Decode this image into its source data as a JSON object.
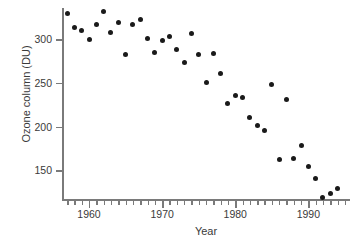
{
  "chart_data": {
    "type": "scatter",
    "title": "",
    "xlabel": "Year",
    "ylabel": "Ozone column (DU)",
    "xlim": [
      1956.3,
      1995.7
    ],
    "ylim": [
      116,
      336
    ],
    "grid": false,
    "legend": null,
    "marker": {
      "shape": "circle",
      "color": "#1a1a1a",
      "size": 5
    },
    "xticks_major": [
      1960,
      1970,
      1980,
      1990
    ],
    "xtick_labels": [
      "1960",
      "1970",
      "1980",
      "1990"
    ],
    "xticks_minor_step": 1,
    "yticks": [
      150,
      200,
      250,
      300
    ],
    "ytick_labels": [
      "150",
      "200",
      "250",
      "300"
    ],
    "x": [
      1957,
      1958,
      1959,
      1960,
      1961,
      1962,
      1963,
      1964,
      1965,
      1966,
      1967,
      1968,
      1969,
      1970,
      1971,
      1972,
      1973,
      1974,
      1975,
      1976,
      1977,
      1978,
      1979,
      1980,
      1981,
      1982,
      1983,
      1984,
      1985,
      1986,
      1987,
      1988,
      1989,
      1990,
      1991,
      1992,
      1993,
      1994,
      1995
    ],
    "y": [
      330,
      314,
      310,
      300,
      317,
      332,
      308,
      319,
      283,
      317,
      323,
      301,
      285,
      299,
      303,
      289,
      274,
      307,
      283,
      251,
      284,
      261,
      227,
      236,
      234,
      210,
      201,
      196,
      248,
      162,
      231,
      163,
      178,
      154,
      141,
      119,
      123,
      129,
      0
    ],
    "points": [
      {
        "year": 1957,
        "ozone": 330
      },
      {
        "year": 1958,
        "ozone": 314
      },
      {
        "year": 1959,
        "ozone": 310
      },
      {
        "year": 1960,
        "ozone": 300
      },
      {
        "year": 1961,
        "ozone": 317
      },
      {
        "year": 1962,
        "ozone": 332
      },
      {
        "year": 1963,
        "ozone": 308
      },
      {
        "year": 1964,
        "ozone": 319
      },
      {
        "year": 1965,
        "ozone": 283
      },
      {
        "year": 1966,
        "ozone": 317
      },
      {
        "year": 1967,
        "ozone": 323
      },
      {
        "year": 1968,
        "ozone": 301
      },
      {
        "year": 1969,
        "ozone": 285
      },
      {
        "year": 1970,
        "ozone": 299
      },
      {
        "year": 1971,
        "ozone": 303
      },
      {
        "year": 1972,
        "ozone": 289
      },
      {
        "year": 1973,
        "ozone": 274
      },
      {
        "year": 1974,
        "ozone": 307
      },
      {
        "year": 1975,
        "ozone": 283
      },
      {
        "year": 1976,
        "ozone": 251
      },
      {
        "year": 1977,
        "ozone": 284
      },
      {
        "year": 1978,
        "ozone": 261
      },
      {
        "year": 1979,
        "ozone": 227
      },
      {
        "year": 1980,
        "ozone": 236
      },
      {
        "year": 1981,
        "ozone": 234
      },
      {
        "year": 1982,
        "ozone": 210
      },
      {
        "year": 1983,
        "ozone": 201
      },
      {
        "year": 1984,
        "ozone": 196
      },
      {
        "year": 1985,
        "ozone": 248
      },
      {
        "year": 1986,
        "ozone": 162
      },
      {
        "year": 1987,
        "ozone": 231
      },
      {
        "year": 1988,
        "ozone": 163
      },
      {
        "year": 1989,
        "ozone": 178
      },
      {
        "year": 1990,
        "ozone": 154
      },
      {
        "year": 1991,
        "ozone": 141
      },
      {
        "year": 1992,
        "ozone": 119
      },
      {
        "year": 1993,
        "ozone": 123
      },
      {
        "year": 1994,
        "ozone": 129
      }
    ]
  }
}
